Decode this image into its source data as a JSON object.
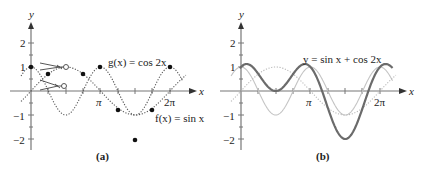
{
  "chart_data": [
    {
      "type": "line",
      "panel": "a",
      "caption": "(a)",
      "xlabel": "x",
      "ylabel": "y",
      "x_ticks": [
        "π",
        "2π"
      ],
      "y_ticks": [
        "2",
        "1",
        "−1",
        "−2"
      ],
      "ylim": [
        -2.5,
        3
      ],
      "xlim": [
        -0.3,
        7
      ],
      "series": [
        {
          "name": "g(x) = cos 2x",
          "style": "dotted",
          "color": "#555555"
        },
        {
          "name": "f(x) = sin x",
          "style": "dotted",
          "color": "#555555"
        }
      ],
      "annotations": [
        "g(x) = cos 2x",
        "f(x) = sin x"
      ],
      "points": [
        {
          "x": 0,
          "y": 1
        },
        {
          "x": 0.785,
          "y": 0.707
        },
        {
          "x": 2.356,
          "y": 0.707
        },
        {
          "x": 3.1416,
          "y": 1
        },
        {
          "x": 3.927,
          "y": -0.707
        },
        {
          "x": 4.712,
          "y": -2
        },
        {
          "x": 5.498,
          "y": -0.707
        },
        {
          "x": 6.283,
          "y": 1
        }
      ]
    },
    {
      "type": "line",
      "panel": "b",
      "caption": "(b)",
      "xlabel": "x",
      "ylabel": "y",
      "x_ticks": [
        "π",
        "2π"
      ],
      "y_ticks": [
        "2",
        "1",
        "−1",
        "−2"
      ],
      "ylim": [
        -2.5,
        3
      ],
      "xlim": [
        -0.3,
        7
      ],
      "series": [
        {
          "name": "y = sin x + cos 2x",
          "style": "solid",
          "color": "#6b6b6b"
        },
        {
          "name": "sin x",
          "style": "dotted",
          "color": "#b0b0b0"
        },
        {
          "name": "cos 2x",
          "style": "solid-light",
          "color": "#c8c8c8"
        }
      ],
      "annotations": [
        "y = sin x + cos 2x"
      ]
    }
  ],
  "panel_a": {
    "y_axis_label": "y",
    "x_axis_label": "x",
    "tick_pi": "π",
    "tick_2pi": "2π",
    "y2": "2",
    "y1": "1",
    "ym1": "−1",
    "ym2": "−2",
    "label_g": "g(x) = cos 2x",
    "label_f": "f(x) = sin x",
    "caption": "(a)"
  },
  "panel_b": {
    "y_axis_label": "y",
    "x_axis_label": "x",
    "tick_pi": "π",
    "tick_2pi": "2π",
    "y2": "2",
    "y1": "1",
    "ym1": "−1",
    "ym2": "−2",
    "label_sum": "y = sin x + cos 2x",
    "caption": "(b)"
  }
}
